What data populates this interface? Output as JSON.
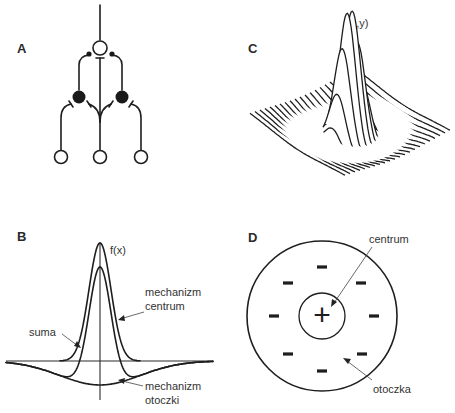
{
  "figure": {
    "panels": {
      "A": {
        "label": "A",
        "description": "neural circuit: three input cells, two inhibitory interneurons, one output cell"
      },
      "B": {
        "label": "B",
        "axis_label": "f(x)",
        "curves": {
          "center": [
            "mechanizm",
            "centrum"
          ],
          "sum": "suma",
          "surround": [
            "mechanizm",
            "otoczki"
          ]
        }
      },
      "C": {
        "label": "C",
        "axis_label": "f(x,y)",
        "description": "3D mesh of Mexican-hat (difference-of-Gaussians) function"
      },
      "D": {
        "label": "D",
        "center_symbol": "+",
        "surround_symbol": "−",
        "center_label": "centrum",
        "surround_label": "otoczka"
      }
    },
    "colors": {
      "line": "#1e1e1e",
      "background": "#ffffff"
    }
  }
}
